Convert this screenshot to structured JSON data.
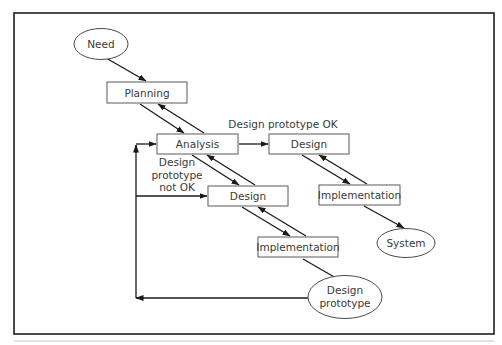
{
  "diagram": {
    "title": "",
    "nodes": {
      "need": {
        "label": "Need",
        "shape": "ellipse"
      },
      "planning": {
        "label": "Planning",
        "shape": "box"
      },
      "analysis": {
        "label": "Analysis",
        "shape": "box"
      },
      "design_ok": {
        "label": "Design",
        "shape": "box"
      },
      "implementation_ok": {
        "label": "Implementation",
        "shape": "box"
      },
      "system": {
        "label": "System",
        "shape": "ellipse"
      },
      "design_proto": {
        "label": "Design",
        "shape": "box"
      },
      "implementation_proto": {
        "label": "Implementation",
        "shape": "box"
      },
      "design_prototype": {
        "label_line1": "Design",
        "label_line2": "prototype",
        "shape": "ellipse"
      }
    },
    "annotations": {
      "prototype_ok": "Design prototype OK",
      "prototype_not_ok_line1": "Design",
      "prototype_not_ok_line2": "prototype",
      "prototype_not_ok_line3": "not OK"
    },
    "edges": [
      {
        "from": "Need",
        "to": "Planning"
      },
      {
        "from": "Planning",
        "to": "Analysis"
      },
      {
        "from": "Analysis",
        "to": "Planning"
      },
      {
        "from": "Analysis",
        "to": "Design",
        "label": "Design prototype OK"
      },
      {
        "from": "Design",
        "to": "Implementation"
      },
      {
        "from": "Implementation",
        "to": "Design"
      },
      {
        "from": "Implementation",
        "to": "System"
      },
      {
        "from": "Analysis",
        "to": "Design (prototype)"
      },
      {
        "from": "Design (prototype)",
        "to": "Analysis"
      },
      {
        "from": "Design (prototype)",
        "to": "Implementation (prototype)"
      },
      {
        "from": "Implementation (prototype)",
        "to": "Design (prototype)"
      },
      {
        "from": "Implementation (prototype)",
        "to": "Design prototype"
      },
      {
        "from": "Design prototype",
        "to": "Analysis",
        "label": "Design prototype not OK"
      },
      {
        "from": "Design prototype",
        "to": "Design (prototype)",
        "label": "Design prototype not OK"
      }
    ],
    "colors": {
      "frame": "#1e1e1e",
      "node_stroke": "#5a5a5a",
      "edge": "#1a1a1a",
      "text": "#3a3a3a",
      "background": "#ffffff"
    }
  }
}
